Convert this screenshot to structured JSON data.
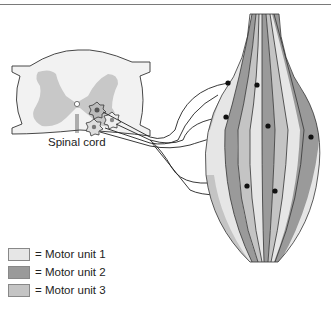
{
  "figure": {
    "spinal_cord_label": "Spinal cord",
    "legend": [
      {
        "label": "= Motor unit 1",
        "color": "#e6e6e6"
      },
      {
        "label": "= Motor unit 2",
        "color": "#9a9a9a"
      },
      {
        "label": "= Motor unit 3",
        "color": "#c4c4c4"
      }
    ],
    "colors": {
      "white_matter": "#f2f2f2",
      "gray_matter": "#c8c8c8",
      "outline": "#333333",
      "motor_neuron": "#555555"
    }
  }
}
